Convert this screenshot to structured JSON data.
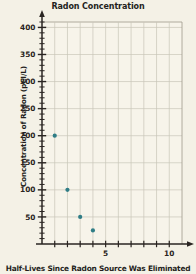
{
  "chart_data": {
    "type": "scatter",
    "title": "Radon Concentration",
    "xlabel": "Half-Lives Since Radon Source Was Eliminated",
    "ylabel": "Concentration of Radon (pCI/L)",
    "x": [
      1,
      2,
      3,
      4
    ],
    "values": [
      200,
      100,
      50,
      25
    ],
    "points": [
      {
        "x": 1,
        "y": 200
      },
      {
        "x": 2,
        "y": 100
      },
      {
        "x": 3,
        "y": 50
      },
      {
        "x": 4,
        "y": 25
      }
    ],
    "xlim": [
      0,
      11
    ],
    "ylim": [
      0,
      410
    ],
    "xticks": [
      1,
      2,
      3,
      4,
      5,
      6,
      7,
      8,
      9,
      10
    ],
    "xtick_labels": [
      "",
      "",
      "",
      "",
      "5",
      "",
      "",
      "",
      "",
      "10"
    ],
    "yticks": [
      50,
      100,
      150,
      200,
      250,
      300,
      350,
      400
    ],
    "ytick_labels": [
      "50",
      "100",
      "150",
      "200",
      "250",
      "300",
      "350",
      "400"
    ],
    "y_minor_step": 10,
    "grid": true,
    "legend": null,
    "marker_color": "#2f7d86",
    "grid_color": "#c9c6b8",
    "axis_color": "#2a2522",
    "background_color": "#f4f1e6"
  }
}
